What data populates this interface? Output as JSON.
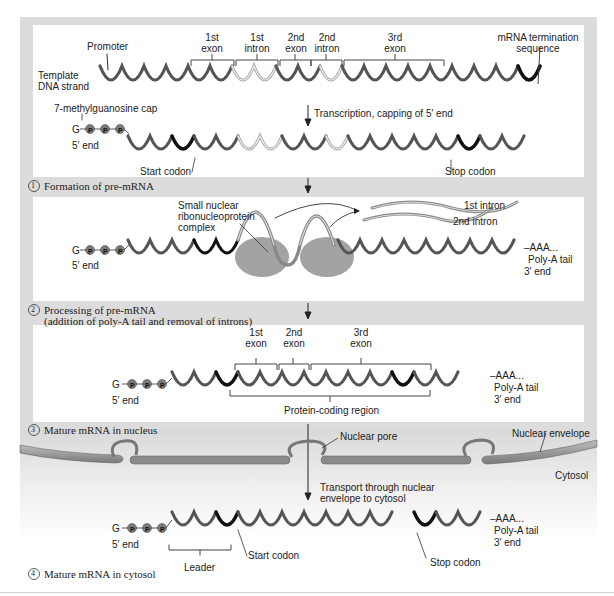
{
  "figure": {
    "colors": {
      "frame_grey": "#dcdcdc",
      "panel_white": "#ffffff",
      "strand_dark": "#555555",
      "strand_black": "#111111",
      "intron_light": "#b8b8b8",
      "snrnp_grey": "#9a9a9a",
      "envelope_grey": "#8a8a8a",
      "phosphate_grey": "#777777"
    },
    "panel1": {
      "strand_label": "Template\nDNA strand",
      "promoter_label": "Promoter",
      "segments": [
        {
          "line1": "1st",
          "line2": "exon"
        },
        {
          "line1": "1st",
          "line2": "intron"
        },
        {
          "line1": "2nd",
          "line2": "exon"
        },
        {
          "line1": "2nd",
          "line2": "intron"
        },
        {
          "line1": "3rd",
          "line2": "exon"
        }
      ],
      "termination_label": "mRNA termination\nsequence",
      "arrow_label": "Transcription, capping of 5′ end",
      "cap_label": "7-methylguanosine cap",
      "cap_g": "G",
      "phosphate": "P",
      "five_prime": "5′ end",
      "start_codon": "Start codon",
      "stop_codon": "Stop codon"
    },
    "step1": {
      "number": "1",
      "label": "Formation of pre-mRNA"
    },
    "panel2": {
      "snrnp_label": "Small nuclear\nribonucleoprotein\ncomplex",
      "intron1_label": "1st intron",
      "intron2_label": "2nd intron",
      "cap_g": "G",
      "phosphate": "P",
      "five_prime": "5′ end",
      "poly_a": "–AAA...",
      "poly_a_tail": "Poly-A tail",
      "three_prime": "3′ end"
    },
    "step2": {
      "number": "2",
      "label": "Processing of pre-mRNA",
      "sublabel": "(addition of poly-A tail and removal of introns)"
    },
    "panel3": {
      "segments": [
        {
          "line1": "1st",
          "line2": "exon"
        },
        {
          "line1": "2nd",
          "line2": "exon"
        },
        {
          "line1": "3rd",
          "line2": "exon"
        }
      ],
      "cap_g": "G",
      "phosphate": "P",
      "five_prime": "5′ end",
      "poly_a": "–AAA...",
      "poly_a_tail": "Poly-A tail",
      "three_prime": "3′ end",
      "coding_region": "Protein-coding region"
    },
    "step3": {
      "number": "3",
      "label": "Mature mRNA in nucleus"
    },
    "envelope": {
      "pore_label": "Nuclear pore",
      "envelope_label": "Nuclear envelope",
      "cytosol_label": "Cytosol",
      "transport_label": "Transport through nuclear\nenvelope to cytosol"
    },
    "panel4": {
      "cap_g": "G",
      "phosphate": "P",
      "five_prime": "5′ end",
      "poly_a": "–AAA...",
      "poly_a_tail": "Poly-A tail",
      "three_prime": "3′ end",
      "leader": "Leader",
      "start_codon": "Start codon",
      "stop_codon": "Stop codon"
    },
    "step4": {
      "number": "4",
      "label": "Mature mRNA in cytosol"
    }
  }
}
